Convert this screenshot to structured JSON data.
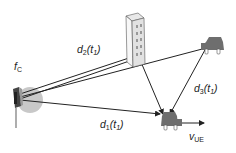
{
  "diagram": {
    "type": "multipath propagation scenario",
    "colors": {
      "line": "#222222",
      "antenna_halo": "#c8c8c8",
      "vehicle": "#6e6e6e",
      "building": "#f0f0f0"
    },
    "nodes": {
      "transmitter": {
        "label_main": "f",
        "label_sub": "C",
        "icon": "antenna-icon"
      },
      "building": {
        "icon": "building-icon"
      },
      "scatterer_vehicle": {
        "icon": "car-icon"
      },
      "receiver_vehicle": {
        "icon": "car-icon",
        "velocity_main": "v",
        "velocity_sub": "UE"
      }
    },
    "paths": [
      {
        "id": "d1",
        "main": "d",
        "sub": "1",
        "arg_open": "(t",
        "arg_sub": "1",
        "arg_close": ")",
        "route": "direct transmitter to UE"
      },
      {
        "id": "d2",
        "main": "d",
        "sub": "2",
        "arg_open": "(t",
        "arg_sub": "1",
        "arg_close": ")",
        "route": "transmitter via building to UE"
      },
      {
        "id": "d3",
        "main": "d",
        "sub": "3",
        "arg_open": "(t",
        "arg_sub": "1",
        "arg_close": ")",
        "route": "transmitter via scatterer vehicle to UE"
      }
    ]
  }
}
